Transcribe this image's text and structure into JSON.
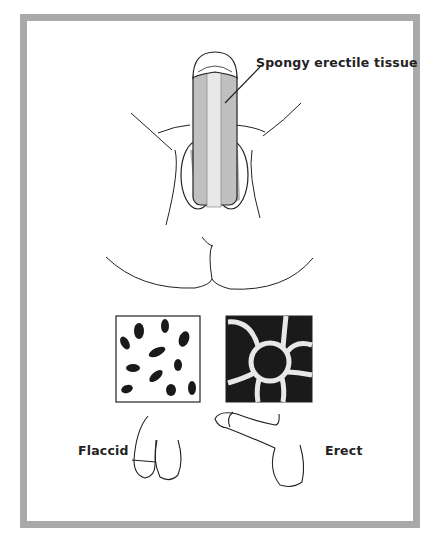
{
  "figure": {
    "callout_label": "Spongy erectile tissue",
    "flaccid_label": "Flaccid",
    "erect_label": "Erect"
  },
  "panels": {
    "left": {
      "state": "flaccid",
      "tissue": "collapsed vascular spaces"
    },
    "right": {
      "state": "erect",
      "tissue": "engorged vascular spaces"
    }
  },
  "colors": {
    "frame": "#a9a9a9",
    "shading": "#b8b8b8",
    "ink": "#222222",
    "panel_dark": "#1a1a1a"
  }
}
